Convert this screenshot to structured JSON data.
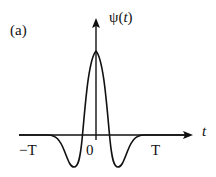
{
  "figure": {
    "panel_label": "(a)",
    "y_axis_label_prefix": "ψ",
    "y_axis_label_paren_open": "(",
    "y_axis_label_var": "t",
    "y_axis_label_paren_close": ")",
    "x_axis_label": "t",
    "ticks": {
      "neg_T": "−T",
      "zero": "0",
      "pos_T": "T"
    },
    "curve_description": "Mexican-hat shaped wavelet ψ(t): central positive peak at t=0, two negative side lobes, decaying to zero beyond ±T",
    "colors": {
      "stroke": "#111111",
      "background": "#ffffff"
    }
  }
}
